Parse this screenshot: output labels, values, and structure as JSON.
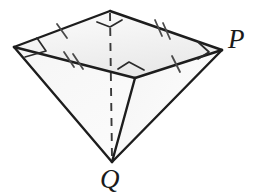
{
  "figure": {
    "kind": "geometry-solid-diagram",
    "background_color": "#ffffff",
    "stroke_color": "#1d1d1d",
    "face_fill_top": "#f1f1f1",
    "face_fill_left": "#f7f7f7",
    "face_fill_right": "#fbfbfb",
    "hidden_edge_style": "dashed",
    "labels": {
      "p": "P",
      "q": "Q"
    },
    "vertices": {
      "top": {
        "name": "top-vertex",
        "x": 110,
        "y": 11
      },
      "left": {
        "name": "left-vertex",
        "x": 14,
        "y": 47
      },
      "near": {
        "name": "near-vertex",
        "x": 135,
        "y": 78
      },
      "right": {
        "name": "right-vertex-p",
        "x": 222,
        "y": 50
      },
      "apex": {
        "name": "apex-vertex-q",
        "x": 112,
        "y": 162
      }
    },
    "edges": [
      {
        "name": "edge-left-to-top",
        "from": "left",
        "to": "top",
        "ticks": 1,
        "style": "solid"
      },
      {
        "name": "edge-top-to-right",
        "from": "top",
        "to": "right",
        "ticks": 2,
        "style": "solid"
      },
      {
        "name": "edge-left-to-near",
        "from": "left",
        "to": "near",
        "ticks": 2,
        "style": "solid"
      },
      {
        "name": "edge-near-to-right",
        "from": "near",
        "to": "right",
        "ticks": 1,
        "style": "solid"
      },
      {
        "name": "edge-left-to-apex",
        "from": "left",
        "to": "apex",
        "ticks": 0,
        "style": "solid"
      },
      {
        "name": "edge-near-to-apex",
        "from": "near",
        "to": "apex",
        "ticks": 0,
        "style": "solid"
      },
      {
        "name": "edge-right-to-apex",
        "from": "right",
        "to": "apex",
        "ticks": 0,
        "style": "solid"
      },
      {
        "name": "edge-top-to-apex-hidden",
        "from": "top",
        "to": "apex",
        "ticks": 0,
        "style": "dashed"
      }
    ],
    "right_angle_markers": [
      {
        "name": "right-angle-left-vertex",
        "at": "left"
      },
      {
        "name": "right-angle-top-vertex",
        "at": "top"
      },
      {
        "name": "right-angle-near-vertex",
        "at": "near"
      },
      {
        "name": "right-angle-right-vertex",
        "at": "right"
      }
    ],
    "tick_marks_summary": {
      "single_tick_edges": [
        "edge-left-to-top",
        "edge-near-to-right"
      ],
      "double_tick_edges": [
        "edge-top-to-right",
        "edge-left-to-near"
      ]
    }
  }
}
